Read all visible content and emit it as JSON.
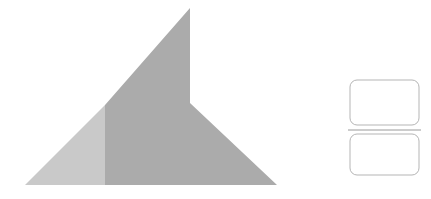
{
  "canvas": {
    "width": 431,
    "height": 199,
    "background_color": "#ffffff",
    "title": "Abstract geometric shapes illustration"
  },
  "palette": {
    "polygon_light_gray": "#c9c9c9",
    "polygon_dark_gray": "#ababab",
    "rectangle_fill": "#ffffff",
    "rectangle_stroke": "#b5b5b5",
    "divider_stroke": "#9a9a9a"
  },
  "shapes": {
    "polygon_group": {
      "name": "two-tone-angular-polygon",
      "description": "Large angular polygon resembling a mountain or arrow form, split vertically into a lighter left face and a darker right face",
      "apex": {
        "x": 190,
        "y": 8
      },
      "notch": {
        "x": 190,
        "y": 103
      },
      "base_left": {
        "x": 25,
        "y": 185
      },
      "base_right": {
        "x": 277,
        "y": 185
      },
      "split_x": 105,
      "split_top_y": 105,
      "faces": [
        {
          "name": "left-light-face",
          "fill": "#c9c9c9",
          "points": "25,185 105,105 105,185"
        },
        {
          "name": "right-dark-face",
          "fill": "#ababab",
          "points": "190,8 190,103 277,185 105,185 105,105"
        }
      ]
    },
    "rectangles": [
      {
        "name": "upper-rounded-rectangle",
        "x": 350,
        "y": 80,
        "width": 69,
        "height": 45,
        "radius": 7,
        "fill": "#ffffff",
        "stroke": "#b5b5b5",
        "stroke_width": 1
      },
      {
        "name": "lower-rounded-rectangle",
        "x": 350,
        "y": 134,
        "width": 69,
        "height": 41,
        "radius": 7,
        "fill": "#ffffff",
        "stroke": "#b5b5b5",
        "stroke_width": 1
      }
    ],
    "divider": {
      "name": "horizontal-divider-line",
      "x1": 348,
      "y1": 130,
      "x2": 421,
      "y2": 130,
      "stroke": "#9a9a9a",
      "stroke_width": 1
    }
  }
}
